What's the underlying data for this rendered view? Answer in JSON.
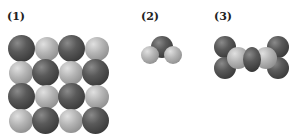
{
  "labels": {
    "panel1": "(1)",
    "panel2": "(2)",
    "panel3": "(3)"
  },
  "panels": [
    {
      "id": 1,
      "description": "4x4 alternating lattice of dark and light spheres (ionic crystal)"
    },
    {
      "id": 2,
      "description": "bent triatomic molecule: one dark central atom with two light atoms"
    },
    {
      "id": 3,
      "description": "symmetric molecule: central dark atom bonded to two light atoms, each bonded to two dark atoms"
    }
  ],
  "colors": {
    "dark_atom": "#4a4a4a",
    "light_atom": "#b0b0b0",
    "background": "#ffffff"
  }
}
